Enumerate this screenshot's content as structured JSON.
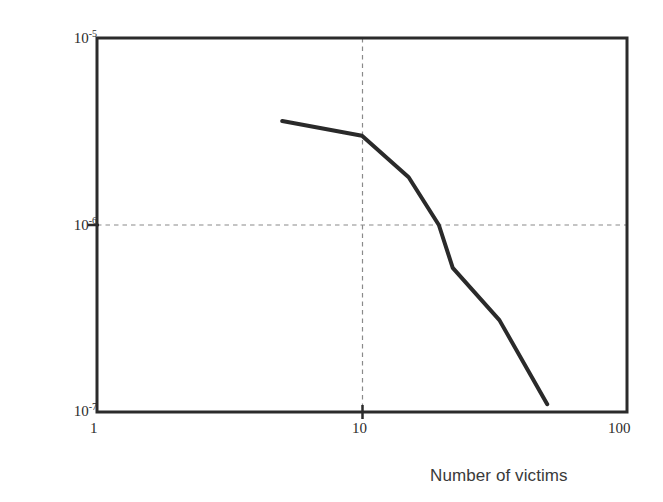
{
  "chart_data": {
    "type": "line",
    "title": "",
    "subtitle": "",
    "xlabel": "Number of victims",
    "ylabel": "Probability",
    "xscale": "log",
    "yscale": "log",
    "xlim": [
      1,
      100
    ],
    "ylim": [
      1e-07,
      1e-05
    ],
    "xticks": [
      1,
      10,
      100
    ],
    "xtick_labels": [
      "1",
      "10",
      "100"
    ],
    "yticks": [
      1e-05,
      1e-06,
      1e-07
    ],
    "ytick_labels": [
      "10-5",
      "10-6",
      "10-7"
    ],
    "grid": "dashed gridlines at x=10 and y=1e-6 only",
    "legend": "none",
    "series": [
      {
        "name": "F-N curve",
        "color": "#2a2a2a",
        "linewidth": 4,
        "x": [
          5.0,
          10.0,
          15.0,
          19.5,
          22.0,
          33.0,
          50.0
        ],
        "y": [
          3.6e-06,
          3e-06,
          1.8e-06,
          1e-06,
          5.9e-07,
          3.1e-07,
          1.1e-07
        ]
      }
    ],
    "annotations": []
  },
  "axes": {
    "y_top_mantissa": "10",
    "y_top_exponent": "-5",
    "y_mid_mantissa": "10",
    "y_mid_exponent": "-6",
    "y_bottom_mantissa": "10",
    "y_bottom_exponent": "-7",
    "x_left": "1",
    "x_mid": "10",
    "x_right": "100",
    "x_title": "Number of victims",
    "y_title": "Probability"
  },
  "style": {
    "background": "#ffffff",
    "frame_color": "#2b2b2b",
    "grid_color": "#8a8a8a",
    "curve_color": "#2a2a2a"
  }
}
